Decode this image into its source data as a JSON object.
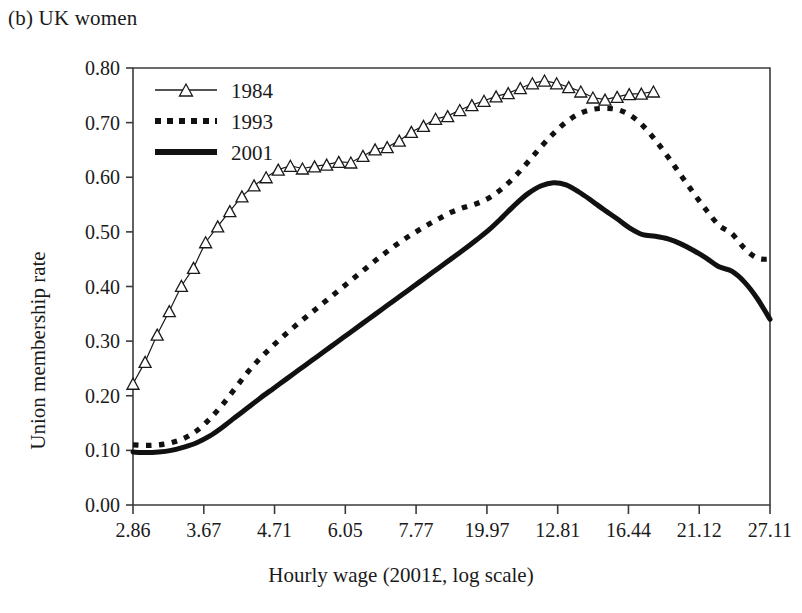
{
  "figure": {
    "panel_label": "(b) UK women",
    "xlabel": "Hourly wage (2001£, log scale)",
    "ylabel": "Union membership rate"
  },
  "legend": {
    "position": "top-left-inside",
    "entries": [
      {
        "key": "1984",
        "label": "1984",
        "style": "thin-line-with-open-triangle-markers"
      },
      {
        "key": "1993",
        "label": "1993",
        "style": "thick-dotted-line"
      },
      {
        "key": "2001",
        "label": "2001",
        "style": "thick-solid-line"
      }
    ]
  },
  "axes": {
    "y_ticks": [
      "0.00",
      "0.10",
      "0.20",
      "0.30",
      "0.40",
      "0.50",
      "0.60",
      "0.70",
      "0.80"
    ],
    "x_ticks": [
      "2.86",
      "3.67",
      "4.71",
      "6.05",
      "7.77",
      "19.97",
      "12.81",
      "16.44",
      "21.12",
      "27.11"
    ]
  },
  "chart_data": {
    "type": "line",
    "title": "(b) UK women",
    "xlabel": "Hourly wage (2001£, log scale)",
    "ylabel": "Union membership rate",
    "xlim": [
      0,
      1
    ],
    "ylim": [
      0.0,
      0.8
    ],
    "grid": false,
    "legend_position": "upper left",
    "x_tick_labels": [
      "2.86",
      "3.67",
      "4.71",
      "6.05",
      "7.77",
      "19.97",
      "12.81",
      "16.44",
      "21.12",
      "27.11"
    ],
    "x_tick_positions": [
      0.0,
      0.1111,
      0.2222,
      0.3333,
      0.4444,
      0.5556,
      0.6667,
      0.7778,
      0.8889,
      1.0
    ],
    "y_tick_labels": [
      "0.00",
      "0.10",
      "0.20",
      "0.30",
      "0.40",
      "0.50",
      "0.60",
      "0.70",
      "0.80"
    ],
    "y_tick_values": [
      0.0,
      0.1,
      0.2,
      0.3,
      0.4,
      0.5,
      0.6,
      0.7,
      0.8
    ],
    "series": [
      {
        "name": "1984",
        "marker": "open-triangle",
        "linestyle": "thin-solid",
        "x": [
          0.0,
          0.019,
          0.038,
          0.057,
          0.076,
          0.095,
          0.114,
          0.133,
          0.152,
          0.171,
          0.19,
          0.209,
          0.228,
          0.247,
          0.266,
          0.285,
          0.304,
          0.323,
          0.342,
          0.361,
          0.38,
          0.399,
          0.418,
          0.437,
          0.456,
          0.475,
          0.494,
          0.513,
          0.532,
          0.551,
          0.57,
          0.589,
          0.608,
          0.627,
          0.646,
          0.665,
          0.684,
          0.703,
          0.722,
          0.741,
          0.76,
          0.779,
          0.798,
          0.817
        ],
        "y": [
          0.222,
          0.262,
          0.312,
          0.355,
          0.401,
          0.434,
          0.481,
          0.51,
          0.538,
          0.565,
          0.585,
          0.6,
          0.614,
          0.621,
          0.616,
          0.62,
          0.623,
          0.628,
          0.627,
          0.639,
          0.651,
          0.655,
          0.667,
          0.683,
          0.694,
          0.707,
          0.712,
          0.723,
          0.732,
          0.74,
          0.748,
          0.754,
          0.763,
          0.772,
          0.777,
          0.772,
          0.765,
          0.757,
          0.746,
          0.742,
          0.747,
          0.752,
          0.753,
          0.757
        ]
      },
      {
        "name": "1993",
        "marker": "none",
        "linestyle": "dotted-thick",
        "x": [
          0.0,
          0.02,
          0.04,
          0.06,
          0.08,
          0.1,
          0.12,
          0.14,
          0.16,
          0.18,
          0.2,
          0.22,
          0.24,
          0.26,
          0.28,
          0.3,
          0.32,
          0.34,
          0.36,
          0.38,
          0.4,
          0.42,
          0.44,
          0.46,
          0.48,
          0.5,
          0.52,
          0.54,
          0.56,
          0.58,
          0.6,
          0.62,
          0.64,
          0.66,
          0.68,
          0.7,
          0.72,
          0.74,
          0.76,
          0.78,
          0.8,
          0.82,
          0.84,
          0.86,
          0.88,
          0.9,
          0.92,
          0.94,
          0.96,
          0.98,
          1.0
        ],
        "y": [
          0.11,
          0.109,
          0.11,
          0.114,
          0.122,
          0.136,
          0.157,
          0.183,
          0.213,
          0.243,
          0.269,
          0.292,
          0.313,
          0.333,
          0.352,
          0.371,
          0.39,
          0.409,
          0.428,
          0.447,
          0.465,
          0.482,
          0.497,
          0.511,
          0.524,
          0.536,
          0.545,
          0.552,
          0.563,
          0.58,
          0.602,
          0.628,
          0.655,
          0.68,
          0.701,
          0.716,
          0.724,
          0.726,
          0.724,
          0.714,
          0.695,
          0.668,
          0.637,
          0.604,
          0.571,
          0.54,
          0.512,
          0.497,
          0.47,
          0.452,
          0.45
        ]
      },
      {
        "name": "2001",
        "marker": "none",
        "linestyle": "solid-thick",
        "x": [
          0.0,
          0.02,
          0.04,
          0.06,
          0.08,
          0.1,
          0.12,
          0.14,
          0.16,
          0.18,
          0.2,
          0.22,
          0.24,
          0.26,
          0.28,
          0.3,
          0.32,
          0.34,
          0.36,
          0.38,
          0.4,
          0.42,
          0.44,
          0.46,
          0.48,
          0.5,
          0.52,
          0.54,
          0.56,
          0.58,
          0.6,
          0.62,
          0.64,
          0.66,
          0.68,
          0.7,
          0.72,
          0.74,
          0.76,
          0.78,
          0.8,
          0.82,
          0.84,
          0.86,
          0.88,
          0.9,
          0.92,
          0.94,
          0.96,
          0.98,
          1.0
        ],
        "y": [
          0.097,
          0.096,
          0.097,
          0.1,
          0.106,
          0.114,
          0.126,
          0.142,
          0.16,
          0.178,
          0.196,
          0.213,
          0.23,
          0.247,
          0.264,
          0.281,
          0.298,
          0.315,
          0.332,
          0.349,
          0.366,
          0.383,
          0.4,
          0.417,
          0.434,
          0.451,
          0.468,
          0.486,
          0.505,
          0.527,
          0.55,
          0.57,
          0.584,
          0.59,
          0.586,
          0.573,
          0.557,
          0.54,
          0.524,
          0.507,
          0.495,
          0.492,
          0.487,
          0.478,
          0.466,
          0.452,
          0.436,
          0.428,
          0.408,
          0.378,
          0.34
        ]
      }
    ],
    "annotations": [
      {
        "text": "1984 peak",
        "value": 0.777
      },
      {
        "text": "1993 peak",
        "value": 0.726
      },
      {
        "text": "2001 peak",
        "value": 0.59
      }
    ]
  }
}
